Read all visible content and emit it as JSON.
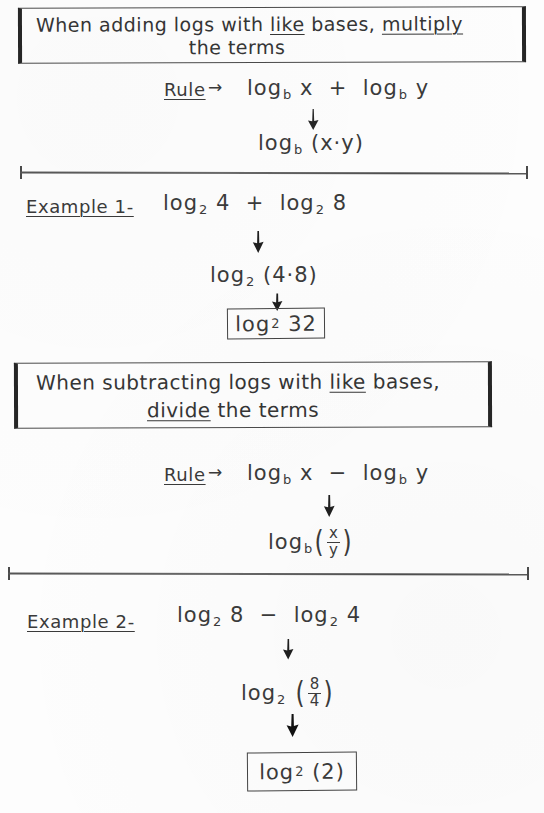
{
  "page": {
    "type": "handwritten-math-notes",
    "topic": "Logarithm Rules",
    "ink_color": "#3a3a3a",
    "paper_color": "#fdfdfd"
  },
  "rule1": {
    "box_line1_a": "When adding logs with ",
    "box_line1_b": "like",
    "box_line1_c": " bases, ",
    "box_line1_d": "multiply",
    "box_line2": "the terms",
    "rule_label": "Rule",
    "rule_arrow": "→",
    "expression": {
      "left_log": "log",
      "left_base": "b",
      "left_arg": "x",
      "operator": "+",
      "right_log": "log",
      "right_base": "b",
      "right_arg": "y"
    },
    "result": {
      "log": "log",
      "base": "b",
      "arg": "(x·y)"
    }
  },
  "example1": {
    "label": "Example 1-",
    "expression": {
      "left_log": "log",
      "left_base": "2",
      "left_arg": "4",
      "operator": "+",
      "right_log": "log",
      "right_base": "2",
      "right_arg": "8"
    },
    "step": {
      "log": "log",
      "base": "2",
      "arg": "(4·8)"
    },
    "answer": {
      "log": "log",
      "base": "2",
      "arg": "32"
    }
  },
  "rule2": {
    "box_line1_a": "When subtracting logs with ",
    "box_line1_b": "like",
    "box_line1_c": " bases,",
    "box_line2_a": "divide",
    "box_line2_b": " the terms",
    "rule_label": "Rule",
    "rule_arrow": "→",
    "expression": {
      "left_log": "log",
      "left_base": "b",
      "left_arg": "x",
      "operator": "−",
      "right_log": "log",
      "right_base": "b",
      "right_arg": "y"
    },
    "result": {
      "log": "log",
      "base": "b",
      "numerator": "x",
      "denominator": "y"
    }
  },
  "example2": {
    "label": "Example 2-",
    "expression": {
      "left_log": "log",
      "left_base": "2",
      "left_arg": "8",
      "operator": "−",
      "right_log": "log",
      "right_base": "2",
      "right_arg": "4"
    },
    "step": {
      "log": "log",
      "base": "2",
      "numerator": "8",
      "denominator": "4"
    },
    "answer": {
      "log": "log",
      "base": "2",
      "arg": "(2)"
    }
  },
  "arrows": {
    "glyph": "down-arrow"
  }
}
